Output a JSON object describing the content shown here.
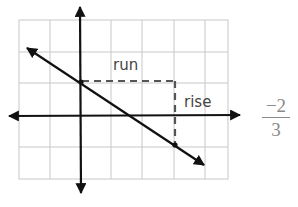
{
  "diagram": {
    "type": "slope-on-coordinate-grid",
    "labels": {
      "run": "run",
      "rise": "rise"
    },
    "slope": {
      "numerator": "−2",
      "denominator": "3"
    },
    "line": {
      "through_points": [
        [
          0,
          1
        ],
        [
          3,
          -1
        ]
      ],
      "y_intercept": [
        0,
        1
      ],
      "second_point": [
        3,
        -1
      ]
    },
    "grid": {
      "x_range": [
        -2,
        5
      ],
      "y_range": [
        -2,
        3
      ]
    },
    "colors": {
      "grid": "#c8c8c8",
      "axes": "#111111",
      "line": "#111111",
      "dash": "#555555",
      "label": "#444444",
      "fraction": "#8a8a8a"
    }
  }
}
